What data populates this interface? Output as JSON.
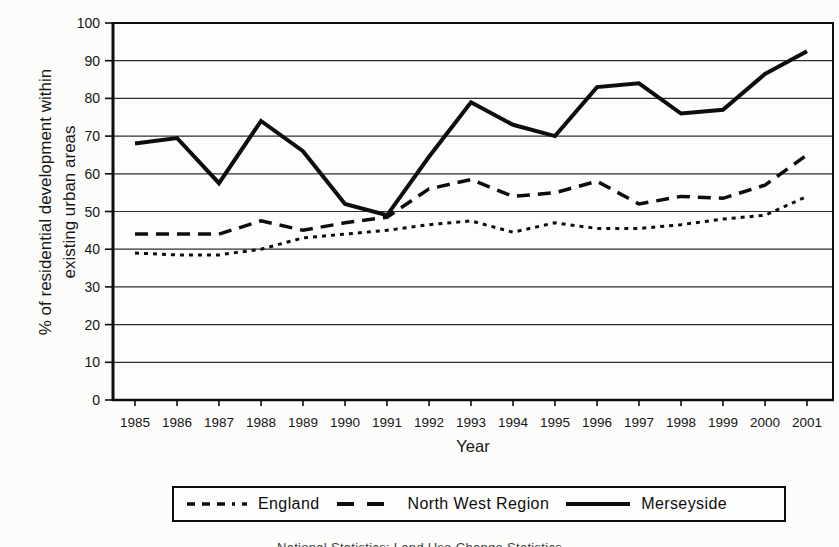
{
  "page": {
    "background_color": "#fcfcfa",
    "ink_color": "#0d0d0d"
  },
  "chart_data": {
    "type": "line",
    "title": "",
    "xlabel": "Year",
    "ylabel": "% of residential development within existing urban areas",
    "ylabel_lines": [
      "% of residential development within",
      "existing urban areas"
    ],
    "x": [
      1985,
      1986,
      1987,
      1988,
      1989,
      1990,
      1991,
      1992,
      1993,
      1994,
      1995,
      1996,
      1997,
      1998,
      1999,
      2000,
      2001
    ],
    "ylim": [
      0,
      100
    ],
    "yticks": [
      0,
      10,
      20,
      30,
      40,
      50,
      60,
      70,
      80,
      90,
      100
    ],
    "grid": "horizontal gridlines on, plot area fully boxed",
    "legend_position": "bottom, boxed",
    "series": [
      {
        "name": "England",
        "line_style": "dotted",
        "values": [
          39,
          38.5,
          38.5,
          40,
          43,
          44,
          45,
          46.5,
          47.5,
          44.5,
          47,
          45.5,
          45.5,
          46.5,
          48,
          49,
          54
        ]
      },
      {
        "name": "North West Region",
        "line_style": "dashed",
        "values": [
          44,
          44,
          44,
          47.5,
          45,
          47,
          48.5,
          56,
          58.5,
          54,
          55,
          58,
          52,
          54,
          53.5,
          57,
          65
        ]
      },
      {
        "name": "Merseyside",
        "line_style": "solid",
        "values": [
          68,
          69.5,
          57.5,
          74,
          66,
          52,
          49,
          64.5,
          79,
          73,
          70,
          83,
          84,
          76,
          77,
          86.5,
          92.5
        ]
      }
    ]
  },
  "footnote": {
    "clipped_caption_text": "National Statistics: Land Use Change Statistics"
  }
}
